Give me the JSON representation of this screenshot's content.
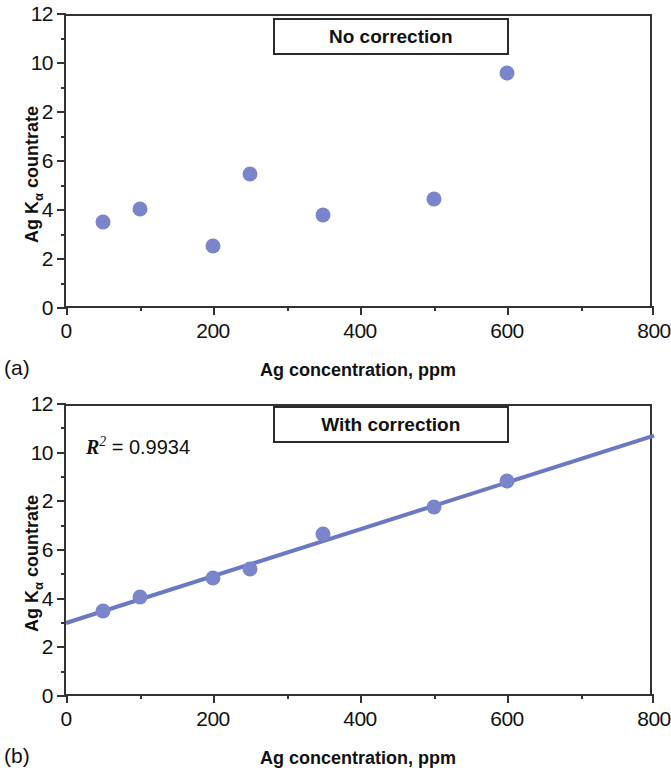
{
  "figure": {
    "marker_color": "#7b85cc",
    "line_color": "#6b78c4",
    "axis_color": "#333333"
  },
  "panels": [
    {
      "tag": "(a)",
      "title": "No correction",
      "annotation": null,
      "xlabel": "Ag concentration, ppm",
      "ylabel_main": "Ag K",
      "ylabel_sub": "α",
      "ylabel_tail": " countrate"
    },
    {
      "tag": "(b)",
      "title": "With correction",
      "annotation": "R2 = 0.9934",
      "annotation_lead": "R",
      "annotation_sup": "2",
      "annotation_rest": " = 0.9934",
      "xlabel": "Ag concentration, ppm",
      "ylabel_main": "Ag K",
      "ylabel_sub": "α",
      "ylabel_tail": " countrate"
    }
  ],
  "chart_data": [
    {
      "type": "scatter",
      "title": "No correction",
      "panel": "(a)",
      "xlabel": "Ag concentration, ppm",
      "ylabel": "Ag Kα countrate",
      "xlim": [
        0,
        800
      ],
      "ylim": [
        0,
        12
      ],
      "xticks": [
        0,
        200,
        400,
        600,
        800
      ],
      "xticklabels": [
        "0",
        "200",
        "400",
        "600",
        "800"
      ],
      "xminorticks": [
        100,
        300,
        500,
        700
      ],
      "yticks": [
        0,
        2,
        4,
        6,
        8,
        10,
        12
      ],
      "yticklabels": [
        "0",
        "2",
        "4",
        "6",
        "2",
        "10",
        "12"
      ],
      "grid": false,
      "legend": "none",
      "x": [
        50,
        100,
        200,
        250,
        350,
        500,
        600
      ],
      "y": [
        3.5,
        4.05,
        2.55,
        5.45,
        3.8,
        4.45,
        9.6
      ],
      "series": [
        {
          "name": "Ag Kα countrate",
          "values": [
            3.5,
            4.05,
            2.55,
            5.45,
            3.8,
            4.45,
            9.6
          ]
        }
      ]
    },
    {
      "type": "scatter",
      "title": "With correction",
      "panel": "(b)",
      "xlabel": "Ag concentration, ppm",
      "ylabel": "Ag Kα countrate",
      "xlim": [
        0,
        800
      ],
      "ylim": [
        0,
        12
      ],
      "xticks": [
        0,
        200,
        400,
        600,
        800
      ],
      "xticklabels": [
        "0",
        "200",
        "400",
        "600",
        "800"
      ],
      "xminorticks": [
        100,
        300,
        500,
        700
      ],
      "yticks": [
        0,
        2,
        4,
        6,
        8,
        10,
        12
      ],
      "yticklabels": [
        "0",
        "2",
        "4",
        "6",
        "2",
        "10",
        "12"
      ],
      "grid": false,
      "legend": "none",
      "annotation": "R² = 0.9934",
      "r_squared": 0.9934,
      "x": [
        50,
        100,
        200,
        250,
        350,
        500,
        600
      ],
      "y": [
        3.5,
        4.05,
        4.85,
        5.2,
        6.65,
        7.75,
        8.85
      ],
      "series": [
        {
          "name": "Ag Kα countrate",
          "values": [
            3.5,
            4.05,
            4.85,
            5.2,
            6.65,
            7.75,
            8.85
          ]
        }
      ],
      "fit_line": {
        "name": "linear regression",
        "x": [
          0,
          800
        ],
        "y": [
          3.0,
          10.7
        ],
        "intercept": 3.0,
        "slope": 0.009625
      }
    }
  ]
}
